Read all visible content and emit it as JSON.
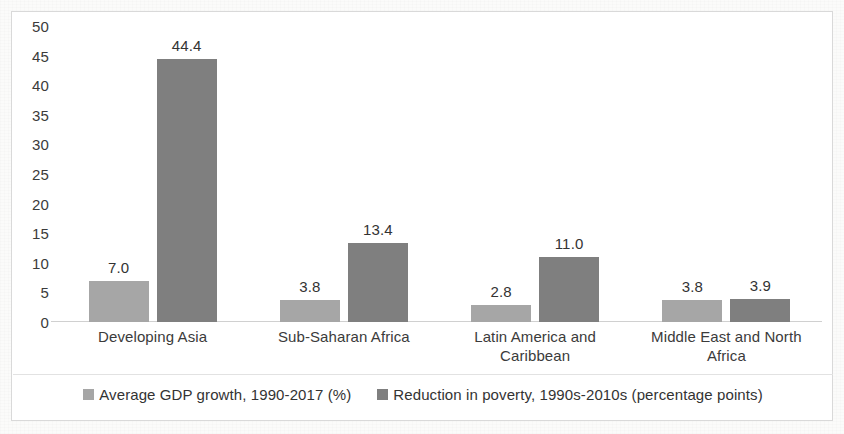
{
  "chart_data": {
    "type": "bar",
    "title": "",
    "subtitle": "",
    "xlabel": "",
    "ylabel": "",
    "ylim": [
      0,
      50
    ],
    "ytick_step": 5,
    "yticks": [
      "50",
      "45",
      "40",
      "35",
      "30",
      "25",
      "20",
      "15",
      "10",
      "5",
      "0"
    ],
    "grid": false,
    "legend_position": "bottom",
    "categories": [
      "Developing Asia",
      "Sub-Saharan Africa",
      "Latin America and Caribbean",
      "Middle East and North Africa"
    ],
    "series": [
      {
        "name": "Average GDP growth, 1990-2017 (%)",
        "color": "#a6a6a6",
        "values": [
          7.0,
          3.8,
          2.8,
          3.8
        ],
        "labels": [
          "7.0",
          "3.8",
          "2.8",
          "3.8"
        ]
      },
      {
        "name": "Reduction in poverty, 1990s-2010s (percentage points)",
        "color": "#7f7f7f",
        "values": [
          44.4,
          13.4,
          11.0,
          3.9
        ],
        "labels": [
          "44.4",
          "13.4",
          "11.0",
          "3.9"
        ]
      }
    ]
  },
  "legend": {
    "items": [
      {
        "label": "Average GDP growth, 1990-2017 (%)",
        "color": "#a6a6a6"
      },
      {
        "label": "Reduction in poverty, 1990s-2010s (percentage points)",
        "color": "#7f7f7f"
      }
    ]
  }
}
